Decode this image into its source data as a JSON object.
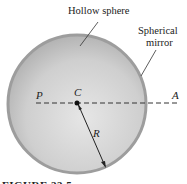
{
  "figure": {
    "labels": {
      "hollow_sphere": "Hollow sphere",
      "spherical_mirror_line1": "Spherical",
      "spherical_mirror_line2": "mirror",
      "point_p": "P",
      "point_c": "C",
      "point_a": "A",
      "radius": "R"
    },
    "caption": "FIGURE 23.5",
    "colors": {
      "sphere_fill_center": "#e4e4e4",
      "sphere_fill_edge": "#b0b0b0",
      "mirror_rim": "#9a9a9a",
      "line": "#222222"
    }
  }
}
